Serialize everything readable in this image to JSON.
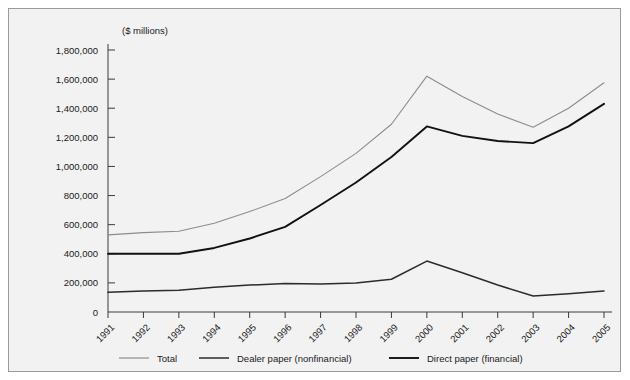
{
  "caption": {
    "clipped_header_text": ""
  },
  "chart_data": {
    "type": "line",
    "title": "",
    "subtitle": "",
    "unit_label": "($ millions)",
    "xlabel": "",
    "ylabel": "",
    "categories": [
      "1991",
      "1992",
      "1993",
      "1994",
      "1995",
      "1996",
      "1997",
      "1998",
      "1999",
      "2000",
      "2001",
      "2002",
      "2003",
      "2004",
      "2005"
    ],
    "ylim": [
      0,
      1800000
    ],
    "ytick_values": [
      0,
      200000,
      400000,
      600000,
      800000,
      1000000,
      1200000,
      1400000,
      1600000,
      1800000
    ],
    "ytick_labels": [
      "0",
      "200,000",
      "400,000",
      "600,000",
      "800,000",
      "1,000,000",
      "1,200,000",
      "1,400,000",
      "1,600,000",
      "1,800,000"
    ],
    "grid": false,
    "legend_position": "bottom",
    "series": [
      {
        "name": "Total",
        "color": "#8c8c8c",
        "width": 1.1,
        "values": [
          530000,
          545000,
          555000,
          610000,
          690000,
          780000,
          930000,
          1090000,
          1290000,
          1620000,
          1480000,
          1360000,
          1270000,
          1400000,
          1575000
        ]
      },
      {
        "name": "Dealer paper (nonfinancial)",
        "color": "#2b2b2b",
        "width": 1.5,
        "values": [
          135000,
          145000,
          150000,
          170000,
          185000,
          195000,
          193000,
          200000,
          225000,
          350000,
          270000,
          185000,
          110000,
          125000,
          145000
        ]
      },
      {
        "name": "Direct paper (financial)",
        "color": "#111111",
        "width": 1.9,
        "values": [
          400000,
          400000,
          400000,
          440000,
          505000,
          585000,
          735000,
          890000,
          1065000,
          1275000,
          1210000,
          1175000,
          1160000,
          1275000,
          1430000
        ]
      }
    ]
  },
  "legend": {
    "items": [
      {
        "label": "Total"
      },
      {
        "label": "Dealer paper (nonfinancial)"
      },
      {
        "label": "Direct paper (financial)"
      }
    ]
  }
}
